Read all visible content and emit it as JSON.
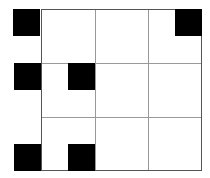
{
  "grid": {
    "rows": 3,
    "cols": 3,
    "line_color": "#999999",
    "border_color": "#555555"
  },
  "black_squares": [
    {
      "position": "top-left-outside",
      "x": 13,
      "y": 9
    },
    {
      "position": "top-right-inside",
      "x": 175,
      "y": 9
    },
    {
      "position": "middle-left-outside",
      "x": 14,
      "y": 63
    },
    {
      "position": "middle-col1-right-half",
      "x": 68,
      "y": 63
    },
    {
      "position": "bottom-left-outside",
      "x": 14,
      "y": 144
    },
    {
      "position": "bottom-col1-right-half",
      "x": 68,
      "y": 144
    }
  ],
  "fill_color": "#000000"
}
